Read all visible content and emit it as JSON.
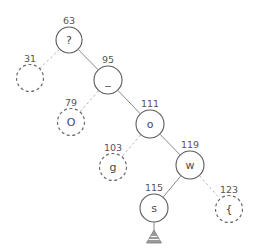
{
  "diagram": {
    "canvas": {
      "width": 259,
      "height": 252,
      "background": "#ffffff"
    },
    "style": {
      "solid_node_stroke": "#5a5a5a",
      "dashed_node_stroke": "#6b6b6b",
      "solid_edge_stroke": "#8a8a8a",
      "dashed_edge_stroke": "#b5b5b5",
      "node_fill": "#ffffff",
      "key_label_color": "#555555",
      "node_value_color": "#4a4a4a",
      "marker_color": "#9a9a9a"
    },
    "nodes": [
      {
        "id": "n63",
        "key": "63",
        "value": "?",
        "cx": 69,
        "cy": 40,
        "r": 13,
        "dashed": false
      },
      {
        "id": "n31",
        "key": "31",
        "value": "",
        "cx": 30,
        "cy": 78,
        "r": 13.5,
        "dashed": true
      },
      {
        "id": "n95",
        "key": "95",
        "value": "_",
        "cx": 108,
        "cy": 80,
        "r": 14,
        "dashed": false
      },
      {
        "id": "n79",
        "key": "79",
        "value": "O",
        "cx": 71,
        "cy": 122,
        "r": 13.5,
        "dashed": true
      },
      {
        "id": "n111",
        "key": "111",
        "value": "o",
        "cx": 150,
        "cy": 124,
        "r": 14,
        "dashed": false
      },
      {
        "id": "n103",
        "key": "103",
        "value": "g",
        "cx": 113,
        "cy": 167,
        "r": 13.5,
        "dashed": true
      },
      {
        "id": "n119",
        "key": "119",
        "value": "w",
        "cx": 190,
        "cy": 165,
        "r": 14,
        "dashed": false
      },
      {
        "id": "n115",
        "key": "115",
        "value": "s",
        "cx": 154,
        "cy": 208,
        "r": 14,
        "dashed": false
      },
      {
        "id": "n123",
        "key": "123",
        "value": "{",
        "cx": 229,
        "cy": 209,
        "r": 13.5,
        "dashed": true
      }
    ],
    "edges": [
      {
        "id": "e63-31",
        "from": "n63",
        "to": "n31",
        "dashed": true
      },
      {
        "id": "e63-95",
        "from": "n63",
        "to": "n95",
        "dashed": false
      },
      {
        "id": "e95-79",
        "from": "n95",
        "to": "n79",
        "dashed": true
      },
      {
        "id": "e95-111",
        "from": "n95",
        "to": "n111",
        "dashed": false
      },
      {
        "id": "e111-103",
        "from": "n111",
        "to": "n103",
        "dashed": true
      },
      {
        "id": "e111-119",
        "from": "n111",
        "to": "n119",
        "dashed": false
      },
      {
        "id": "e119-115",
        "from": "n119",
        "to": "n115",
        "dashed": false
      },
      {
        "id": "e119-123",
        "from": "n119",
        "to": "n123",
        "dashed": true
      }
    ],
    "markers": [
      {
        "id": "m115",
        "icon": "pyramid-marker",
        "node": "n115",
        "cx": 154,
        "cy": 238
      }
    ]
  }
}
